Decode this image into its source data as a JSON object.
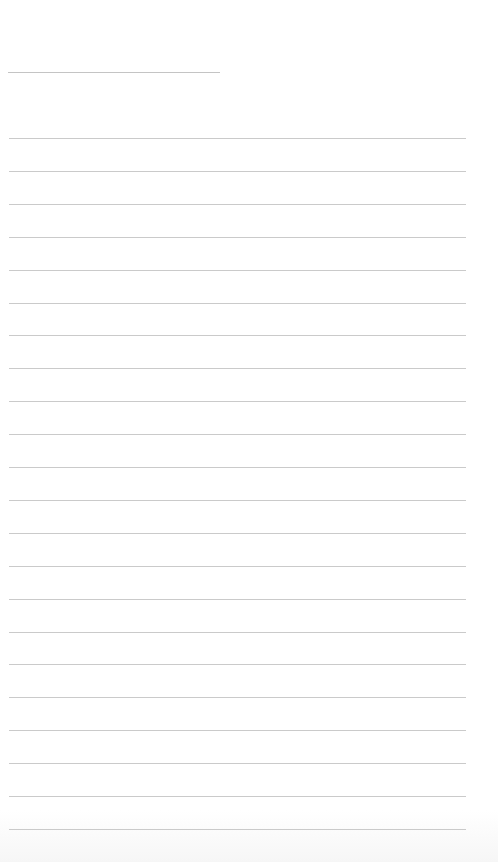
{
  "page": {
    "type": "lined-paper",
    "background_color": "#ffffff",
    "line_color": "#cacaca",
    "header_line": {
      "x": 8,
      "y": 72,
      "width": 212
    },
    "ruled_lines": {
      "count": 22,
      "start_y": 138,
      "spacing": 32.9,
      "x": 9,
      "width": 457
    }
  }
}
